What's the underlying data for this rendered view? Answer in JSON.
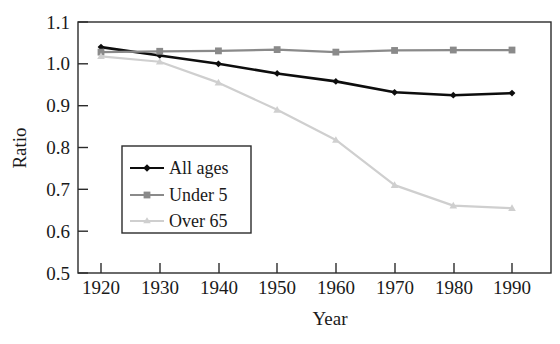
{
  "chart_data": {
    "type": "line",
    "title": "",
    "xlabel": "Year",
    "ylabel": "Ratio",
    "x": [
      1920,
      1930,
      1940,
      1950,
      1960,
      1970,
      1980,
      1990
    ],
    "xticklabels": [
      "1920",
      "1930",
      "1940",
      "1950",
      "1960",
      "1970",
      "1980",
      "1990"
    ],
    "yticklabels": [
      "0.5",
      "0.6",
      "0.7",
      "0.8",
      "0.9",
      "1.0",
      "1.1"
    ],
    "yticks": [
      0.5,
      0.6,
      0.7,
      0.8,
      0.9,
      1.0,
      1.1
    ],
    "xlim": [
      1918,
      1993
    ],
    "ylim": [
      0.5,
      1.1
    ],
    "grid": false,
    "legend_position": "lower-left-inside",
    "series": [
      {
        "name": "All ages",
        "color": "#0d0d0d",
        "marker": "diamond",
        "values": [
          1.04,
          1.02,
          1.0,
          0.977,
          0.958,
          0.932,
          0.925,
          0.93
        ]
      },
      {
        "name": "Under 5",
        "color": "#8a8a8a",
        "marker": "square",
        "values": [
          1.028,
          1.03,
          1.031,
          1.034,
          1.028,
          1.032,
          1.033,
          1.033
        ]
      },
      {
        "name": "Over 65",
        "color": "#cfcfcf",
        "marker": "triangle",
        "values": [
          1.018,
          1.005,
          0.955,
          0.89,
          0.818,
          0.71,
          0.661,
          0.655
        ]
      }
    ]
  },
  "axes": {
    "ylabel": "Ratio",
    "xlabel": "Year"
  },
  "legend": {
    "entries": [
      {
        "label": "All ages"
      },
      {
        "label": "Under 5"
      },
      {
        "label": "Over 65"
      }
    ]
  }
}
